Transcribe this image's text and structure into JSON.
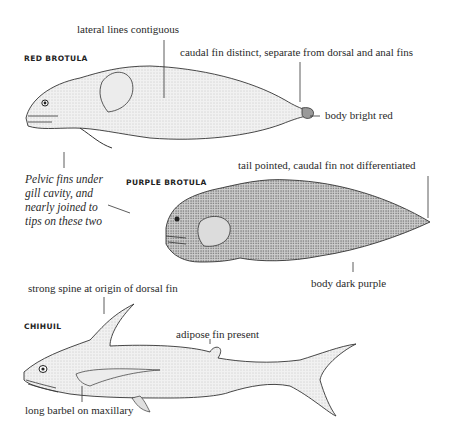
{
  "figures": [
    {
      "name": "RED BROTULA",
      "labels": [
        "lateral lines contiguous",
        "caudal fin distinct, separate from dorsal and anal fins",
        "body bright red"
      ]
    },
    {
      "name": "PURPLE BROTULA",
      "labels": [
        "tail pointed, caudal fin not differentiated",
        "body dark purple"
      ]
    },
    {
      "name": "CHIHUIL",
      "labels": [
        "strong spine at origin of dorsal fin",
        "adipose fin present",
        "long barbel on maxillary"
      ]
    }
  ],
  "shared_note": {
    "lines": [
      "Pelvic fins under",
      "gill cavity, and",
      "nearly joined to",
      "tips on these two"
    ]
  },
  "colors": {
    "ink": "#2a2a2a",
    "stipple_light": "#e4e4e4",
    "stipple_dark": "#a8a8a8"
  }
}
